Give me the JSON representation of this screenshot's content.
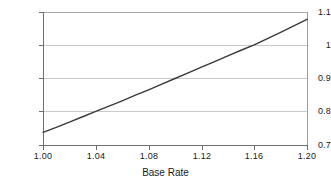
{
  "chart_data": {
    "type": "line",
    "title": "",
    "xlabel": "Base Rate",
    "ylabel": "",
    "xlim": [
      1.0,
      1.2
    ],
    "ylim": [
      0.7,
      1.1
    ],
    "grid": true,
    "legend": false,
    "line_color": "#3a3a3a",
    "grid_color": "#c9c9c9",
    "axis_color": "#6f6f6f",
    "xticks": [
      1.0,
      1.04,
      1.08,
      1.12,
      1.16,
      1.2
    ],
    "xtick_labels": [
      "1.00",
      "1.04",
      "1.08",
      "1.12",
      "1.16",
      "1.20"
    ],
    "yticks": [
      0.7,
      0.8,
      0.9,
      1.0,
      1.1
    ],
    "ytick_labels": [
      "0.7",
      "0.8",
      "0.9",
      "1",
      "1.1"
    ],
    "series": [
      {
        "name": "",
        "x": [
          1.0,
          1.01,
          1.02,
          1.03,
          1.04,
          1.05,
          1.06,
          1.07,
          1.08,
          1.09,
          1.1,
          1.11,
          1.12,
          1.13,
          1.14,
          1.15,
          1.16,
          1.17,
          1.18,
          1.19,
          1.2
        ],
        "y": [
          0.738,
          0.753,
          0.769,
          0.785,
          0.801,
          0.817,
          0.833,
          0.85,
          0.866,
          0.883,
          0.9,
          0.917,
          0.934,
          0.951,
          0.968,
          0.985,
          1.001,
          1.02,
          1.039,
          1.058,
          1.078
        ]
      }
    ]
  },
  "axes": {
    "x_title": "Base Rate"
  }
}
